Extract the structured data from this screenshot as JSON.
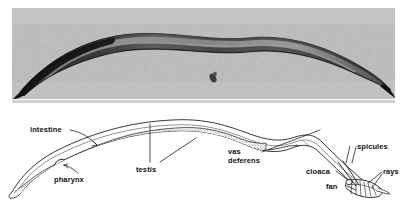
{
  "figure": {
    "kind": "two-panel biology figure"
  },
  "photo_panel": {
    "name": "light micrograph of adult male nematode",
    "background_color": "#b9b9b9",
    "worm_color": "#1c1c1c",
    "debris_particle": "small dark speck"
  },
  "diagram_panel": {
    "name": "labeled schematic drawing of adult male nematode",
    "line_color": "#141414",
    "fill_color": "#ffffff",
    "labels": [
      {
        "text": "intestine",
        "x": 30,
        "y": 126,
        "align": "left"
      },
      {
        "text": "pharynx",
        "x": 54,
        "y": 176,
        "align": "left"
      },
      {
        "text": "testis",
        "x": 136,
        "y": 166,
        "align": "left"
      },
      {
        "text": "vas",
        "x": 228,
        "y": 148,
        "align": "left"
      },
      {
        "text": "deferens",
        "x": 228,
        "y": 157,
        "align": "left"
      },
      {
        "text": "spicules",
        "x": 357,
        "y": 143,
        "align": "left"
      },
      {
        "text": "cloaca",
        "x": 306,
        "y": 168,
        "align": "left"
      },
      {
        "text": "rays",
        "x": 383,
        "y": 168,
        "align": "left"
      },
      {
        "text": "fan",
        "x": 326,
        "y": 183,
        "align": "left"
      }
    ]
  }
}
